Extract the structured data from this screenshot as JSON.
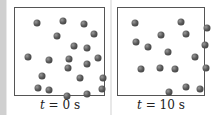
{
  "panels": [
    {
      "label_var": "t",
      "label_rest": " = 0 s",
      "particles": [
        [
          22,
          15
        ],
        [
          48,
          13
        ],
        [
          69,
          16
        ],
        [
          42,
          28
        ],
        [
          79,
          26
        ],
        [
          59,
          38
        ],
        [
          72,
          40
        ],
        [
          13,
          49
        ],
        [
          34,
          52
        ],
        [
          54,
          51
        ],
        [
          83,
          50
        ],
        [
          53,
          60
        ],
        [
          72,
          56
        ],
        [
          27,
          68
        ],
        [
          65,
          70
        ],
        [
          88,
          70
        ],
        [
          23,
          80
        ],
        [
          34,
          82
        ],
        [
          52,
          88
        ],
        [
          72,
          86
        ],
        [
          87,
          81
        ]
      ]
    },
    {
      "label_var": "t",
      "label_rest": " = 10 s",
      "particles": [
        [
          17,
          15
        ],
        [
          63,
          14
        ],
        [
          89,
          20
        ],
        [
          43,
          27
        ],
        [
          68,
          26
        ],
        [
          18,
          34
        ],
        [
          30,
          39
        ],
        [
          87,
          37
        ],
        [
          50,
          44
        ],
        [
          77,
          49
        ],
        [
          23,
          61
        ],
        [
          42,
          60
        ],
        [
          57,
          61
        ],
        [
          88,
          60
        ],
        [
          51,
          84
        ],
        [
          68,
          79
        ],
        [
          82,
          81
        ]
      ]
    }
  ],
  "colors": {
    "particle": "#555555",
    "border": "#555555",
    "background": "#e8e8e8"
  }
}
